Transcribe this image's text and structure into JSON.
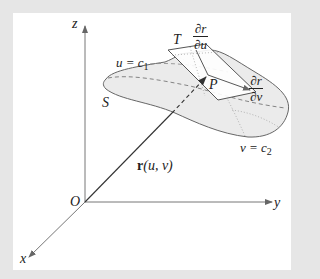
{
  "figure": {
    "type": "parametric-surface-diagram",
    "background_color": "#e6e6e6",
    "panel_color": "#ffffff",
    "surface_fill": "#e9e9e9",
    "stroke_color": "#555555",
    "labels": {
      "z_axis": "z",
      "y_axis": "y",
      "x_axis": "x",
      "origin": "O",
      "surface": "S",
      "point": "P",
      "tangent_plane": "T",
      "position_vector": "r(u, v)",
      "position_vector_bold": "r",
      "position_vector_args": "(u, v)",
      "u_curve": "u = c",
      "u_curve_sub": "1",
      "v_curve": "v = c",
      "v_curve_sub": "2",
      "partial_u": {
        "numerator": "∂r",
        "denominator": "∂u"
      },
      "partial_v": {
        "numerator": "∂r",
        "denominator": "∂v"
      }
    }
  }
}
